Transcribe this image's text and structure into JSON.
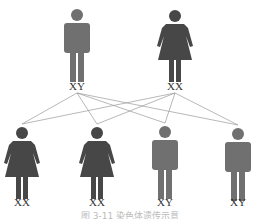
{
  "parents": [
    {
      "label": "XY",
      "sex": "male",
      "x": 77
    },
    {
      "label": "XX",
      "sex": "female",
      "x": 175
    }
  ],
  "children": [
    {
      "label": "XX",
      "sex": "female",
      "x": 22
    },
    {
      "label": "XX",
      "sex": "female",
      "x": 97
    },
    {
      "label": "XY",
      "sex": "male",
      "x": 165
    },
    {
      "label": "XY",
      "sex": "male",
      "x": 238
    }
  ],
  "colors": {
    "male": "#707070",
    "female": "#474747",
    "line": "#999999"
  },
  "caption": "图 3-11 染色体遗传示意"
}
